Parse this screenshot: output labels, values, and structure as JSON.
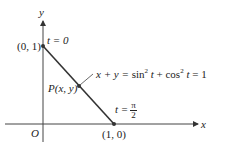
{
  "figure": {
    "axes": {
      "x_label": "x",
      "y_label": "y",
      "origin_label": "O"
    },
    "points": {
      "top": {
        "label": "(0, 1)",
        "param": "t = 0"
      },
      "bottom": {
        "label": "(1, 0)",
        "param_lhs": "t =",
        "param_num": "π",
        "param_den": "2"
      },
      "moving": {
        "label": "P(x, y)"
      }
    },
    "equation": {
      "lhs": "x + y =",
      "sin": "sin",
      "sup1": "2",
      "t1": "t",
      "plus": "+ cos",
      "sup2": "2",
      "t2": "t",
      "rhs": "= 1"
    },
    "colors": {
      "line": "#333333",
      "text": "#222222"
    }
  }
}
